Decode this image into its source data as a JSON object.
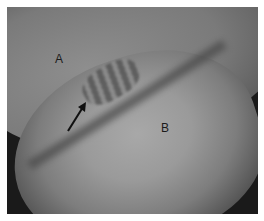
{
  "image": {
    "description": "Grayscale arthroscopic image with two labeled structures and an arrow pointing to a fold between them",
    "labels": [
      {
        "id": "A",
        "text": "A"
      },
      {
        "id": "B",
        "text": "B"
      }
    ],
    "annotations": [
      {
        "type": "arrow",
        "direction": "up-right",
        "color": "#111111"
      }
    ],
    "colors": {
      "border": "#ffffff",
      "background_dark": "#1a1a1a",
      "tissue_light": "#a8a8a8",
      "label_text": "#1b1b1b"
    }
  }
}
